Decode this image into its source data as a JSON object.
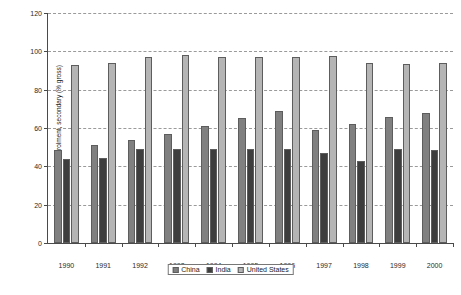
{
  "chart_data": {
    "type": "bar",
    "title": "",
    "xlabel": "",
    "ylabel": "School enrolment, secondary (% gross)",
    "categories": [
      "1990",
      "1991",
      "1992",
      "1993",
      "1994",
      "1995",
      "1996",
      "1997",
      "1998",
      "1999",
      "2000"
    ],
    "series": [
      {
        "name": "China",
        "color": "#808080",
        "values": [
          48.5,
          51.0,
          54.0,
          57.0,
          61.0,
          65.0,
          69.0,
          59.0,
          62.0,
          66.0,
          68.0
        ]
      },
      {
        "name": "India",
        "color": "#3d3d3d",
        "values": [
          44.0,
          44.5,
          49.0,
          49.0,
          49.0,
          49.0,
          49.0,
          47.0,
          43.0,
          49.0,
          48.5
        ]
      },
      {
        "name": "United States",
        "color": "#b5b5b5",
        "values": [
          93.0,
          94.0,
          97.0,
          98.0,
          97.0,
          97.0,
          97.0,
          97.5,
          94.0,
          93.5,
          94.0
        ]
      }
    ],
    "ylim": [
      0,
      120
    ],
    "yticks": [
      0,
      20,
      40,
      60,
      80,
      100,
      120
    ],
    "grid": true,
    "grid_style": "dashed-horizontal",
    "legend_position": "bottom-center",
    "legend_entries": [
      "China",
      "India",
      "United States"
    ]
  }
}
